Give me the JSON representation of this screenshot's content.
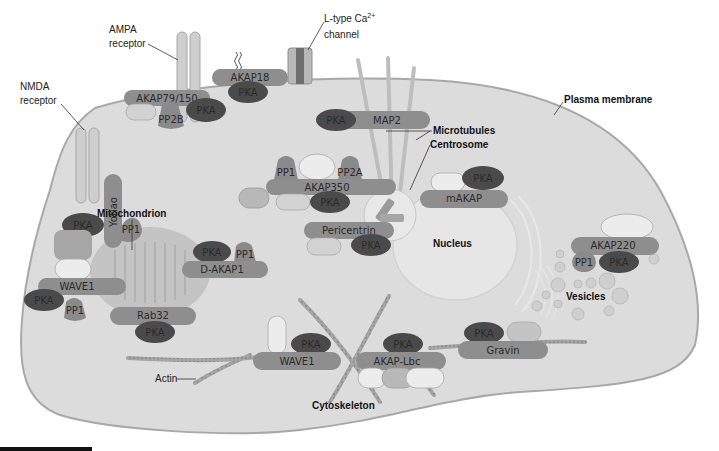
{
  "diagram": {
    "colors": {
      "cell_fill": "#dcdcdc",
      "membrane": "#a8a8a8",
      "akap": "#8e8e8e",
      "pka": "#4a4a4a",
      "phosphatase": "#8a8a8a",
      "light_subunit": "#ececec",
      "mid_subunit": "#b8b8b8",
      "organelle": "#c4c4c4",
      "nucleus": "#e6e6e6",
      "actin": "#a4a4a4",
      "microtubule": "#bdbdbd"
    },
    "region_labels": {
      "plasma_membrane": "Plasma membrane",
      "microtubules": "Microtubules",
      "centrosome": "Centrosome",
      "mitochondrion": "Mitochondrion",
      "nucleus": "Nucleus",
      "vesicles": "Vesicles",
      "cytoskeleton": "Cytoskeleton",
      "actin": "Actin"
    },
    "receptor_labels": {
      "nmda_line1": "NMDA",
      "nmda_line2": "receptor",
      "ampa_line1": "AMPA",
      "ampa_line2": "receptor",
      "ltype_line1": "L-type Ca",
      "ltype_sup": "2+",
      "ltype_line2": "channel"
    },
    "complexes": {
      "yotiao": {
        "akap": "Yotiao",
        "pka": "PKA",
        "pp": "PP1"
      },
      "akap79": {
        "akap": "AKAP79/150",
        "pka": "PKA",
        "pp": "PP2B"
      },
      "akap18": {
        "akap": "AKAP18",
        "pka": "PKA"
      },
      "map2": {
        "akap": "MAP2",
        "pka": "PKA"
      },
      "akap350": {
        "akap": "AKAP350",
        "pka": "PKA",
        "pp1": "PP1",
        "pp2a": "PP2A"
      },
      "makap": {
        "akap": "mAKAP",
        "pka": "PKA"
      },
      "pericentrin": {
        "akap": "Pericentrin",
        "pka": "PKA"
      },
      "dakap1": {
        "akap": "D-AKAP1",
        "pka": "PKA",
        "pp": "PP1"
      },
      "wave1_mito": {
        "akap": "WAVE1",
        "pka": "PKA",
        "pp": "PP1"
      },
      "rab32": {
        "akap": "Rab32",
        "pka": "PKA"
      },
      "akap220": {
        "akap": "AKAP220",
        "pka": "PKA",
        "pp": "PP1"
      },
      "wave1_actin": {
        "akap": "WAVE1",
        "pka": "PKA"
      },
      "akaplbc": {
        "akap": "AKAP-Lbc",
        "pka": "PKA"
      },
      "gravin": {
        "akap": "Gravin",
        "pka": "PKA"
      }
    }
  }
}
